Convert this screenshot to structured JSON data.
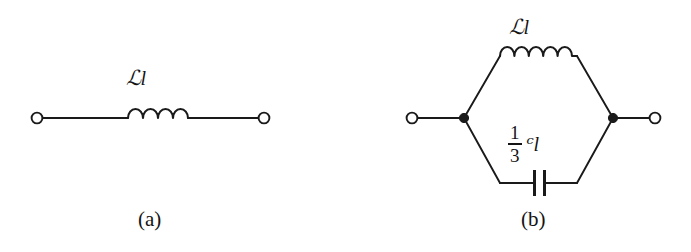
{
  "figure": {
    "type": "circuit-diagram-pair",
    "background_color": "#ffffff",
    "line_color": "#1a1a1a",
    "panels": [
      {
        "id": "a",
        "caption": "(a)",
        "description": "series inductor between two open terminals",
        "elements": {
          "inductor": {
            "label_script": "ℒ",
            "label_italic": "l",
            "label_full": "ℒl",
            "coil_humps": 4
          },
          "terminals": {
            "left_icon": "open-terminal-circle",
            "right_icon": "open-terminal-circle",
            "count": 2
          }
        }
      },
      {
        "id": "b",
        "caption": "(b)",
        "description": "hexagonal two-branch network: inductor on upper branch, capacitor on lower branch, joined at two solid nodes with open terminals",
        "elements": {
          "inductor": {
            "label_script": "ℒ",
            "label_italic": "l",
            "label_full": "ℒl",
            "coil_humps": 4
          },
          "capacitor": {
            "fraction_numerator": "1",
            "fraction_denominator": "3",
            "label_script": "ᶜ",
            "label_italic": "l",
            "label_full": "⅓ ᶜl",
            "plate_count": 2
          },
          "terminals": {
            "left_icon": "open-terminal-circle",
            "right_icon": "open-terminal-circle",
            "count": 2
          },
          "nodes": {
            "icon": "solid-node-dot",
            "count": 2
          }
        }
      }
    ]
  },
  "labels": {
    "inductor_a_script": "ℒ",
    "inductor_a_italic": "l",
    "inductor_b_script": "ℒ",
    "inductor_b_italic": "l",
    "capacitor_numerator": "1",
    "capacitor_denominator": "3",
    "capacitor_script": "ᶜ",
    "capacitor_italic": "l",
    "caption_a": "(a)",
    "caption_b": "(b)"
  }
}
